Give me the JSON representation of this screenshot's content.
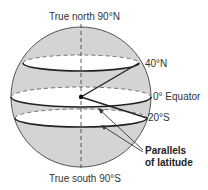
{
  "diagram": {
    "title_north": "True north 90°N",
    "title_south": "True south 90°S",
    "labels": {
      "lat_40n": "40°N",
      "equator": "0° Equator",
      "lat_20s": "20°S",
      "parallels_line1": "Parallels",
      "parallels_line2": "of latitude"
    },
    "colors": {
      "sphere_fill": "#d4d4d4",
      "band_fill": "#ffffff",
      "line": "#333333"
    }
  }
}
